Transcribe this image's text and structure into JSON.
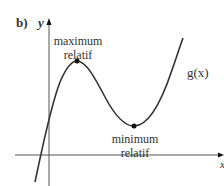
{
  "figure": {
    "part_label": "b)",
    "y_axis_label": "y",
    "x_axis_label": "x",
    "function_label": "g(x)",
    "max_label_line1": "maximum",
    "max_label_line2": "relatif",
    "min_label_line1": "minimum",
    "min_label_line2": "relatif",
    "colors": {
      "curve": "#333333",
      "axes": "#555555",
      "points": "#111111"
    },
    "key_points": {
      "maximum": {
        "px": 77,
        "py": 61
      },
      "minimum": {
        "px": 134,
        "py": 126
      }
    }
  }
}
